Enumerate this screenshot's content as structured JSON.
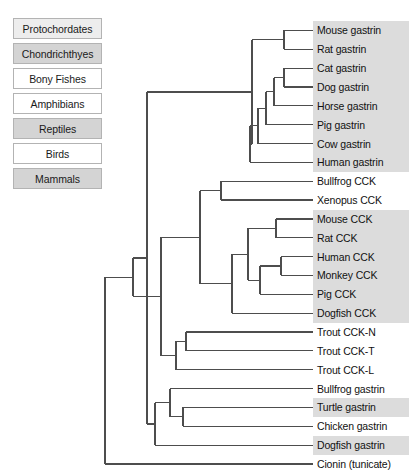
{
  "legend": {
    "items": [
      {
        "label": "Protochordates",
        "shade": "light"
      },
      {
        "label": "Chondrichthyes",
        "shade": "gray"
      },
      {
        "label": "Bony Fishes",
        "shade": "white"
      },
      {
        "label": "Amphibians",
        "shade": "white"
      },
      {
        "label": "Reptiles",
        "shade": "gray"
      },
      {
        "label": "Birds",
        "shade": "white"
      },
      {
        "label": "Mammals",
        "shade": "gray"
      }
    ]
  },
  "colors": {
    "branch": "#4d4d4d",
    "gray_row": "#dcdcdc",
    "white_row": "#ffffff",
    "legend_border": "#b3b3b3",
    "text": "#111111"
  },
  "chart_data": {
    "type": "tree",
    "title": "",
    "orientation": "left-to-right",
    "leaf_count": 24,
    "leaves": [
      {
        "label": "Mouse gastrin",
        "shade": "gray",
        "group": "Mammals",
        "y": 31
      },
      {
        "label": "Rat gastrin",
        "shade": "gray",
        "group": "Mammals",
        "y": 53
      },
      {
        "label": "Cat gastrin",
        "shade": "gray",
        "group": "Mammals",
        "y": 75
      },
      {
        "label": "Dog gastrin",
        "shade": "gray",
        "group": "Mammals",
        "y": 96
      },
      {
        "label": "Horse gastrin",
        "shade": "gray",
        "group": "Mammals",
        "y": 118
      },
      {
        "label": "Pig gastrin",
        "shade": "gray",
        "group": "Mammals",
        "y": 140
      },
      {
        "label": "Cow gastrin",
        "shade": "gray",
        "group": "Mammals",
        "y": 161
      },
      {
        "label": "Human gastrin",
        "shade": "gray",
        "group": "Mammals",
        "y": 183
      },
      {
        "label": "Bullfrog CCK",
        "shade": "white",
        "group": "Amphibians",
        "y": 205
      },
      {
        "label": "Xenopus CCK",
        "shade": "white",
        "group": "Amphibians",
        "y": 226
      },
      {
        "label": "Mouse CCK",
        "shade": "gray",
        "group": "Mammals",
        "y": 248
      },
      {
        "label": "Rat CCK",
        "shade": "gray",
        "group": "Mammals",
        "y": 270
      },
      {
        "label": "Human CCK",
        "shade": "gray",
        "group": "Mammals",
        "y": 291
      },
      {
        "label": "Monkey CCK",
        "shade": "gray",
        "group": "Mammals",
        "y": 313
      },
      {
        "label": "Pig CCK",
        "shade": "gray",
        "group": "Mammals",
        "y": 335
      },
      {
        "label": "Dogfish CCK",
        "shade": "gray",
        "group": "Chondrichthyes",
        "y": 356
      },
      {
        "label": "Trout CCK-N",
        "shade": "white",
        "group": "Bony Fishes",
        "y": 378
      },
      {
        "label": "Trout CCK-T",
        "shade": "white",
        "group": "Bony Fishes",
        "y": 400
      },
      {
        "label": "Trout CCK-L",
        "shade": "white",
        "group": "Bony Fishes",
        "y": 421
      },
      {
        "label": "Bullfrog gastrin",
        "shade": "white",
        "group": "Amphibians",
        "y": 443
      },
      {
        "label": "Turtle gastrin",
        "shade": "gray",
        "group": "Reptiles",
        "y": 465
      },
      {
        "label": "Chicken gastrin",
        "shade": "white",
        "group": "Birds",
        "y": 487
      },
      {
        "label": "Dogfish gastrin",
        "shade": "gray",
        "group": "Chondrichthyes",
        "y": 508
      },
      {
        "label": "Cionin (tunicate)",
        "shade": "white",
        "group": "Protochordates",
        "y": 530
      }
    ]
  }
}
